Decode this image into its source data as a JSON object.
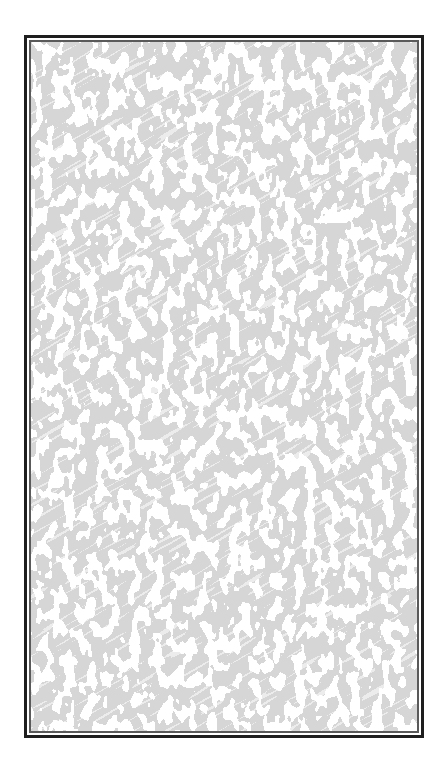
{
  "panel": {
    "kind": "bordered-texture-panel",
    "texture": {
      "pattern": "grey-white-noise-camouflage",
      "base_color": "#d6d6d6",
      "highlight_color": "#ffffff"
    },
    "border": {
      "outer_color": "#1e1e1e",
      "inner_color": "#5a5a5a"
    }
  }
}
